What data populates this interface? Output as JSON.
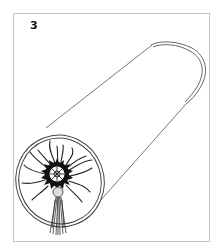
{
  "figure": {
    "step_number": "3",
    "colors": {
      "frame_border": "#c4c4c4",
      "line": "#555555",
      "ink": "#111111",
      "background": "#ffffff"
    }
  }
}
